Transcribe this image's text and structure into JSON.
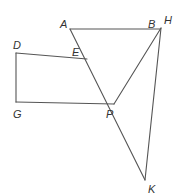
{
  "diagram": {
    "type": "geometry",
    "stroke_color": "#555555",
    "label_color": "#333333",
    "points": {
      "A": {
        "label": "A",
        "x": 70,
        "y": 29,
        "lx": 60,
        "ly": 28
      },
      "B": {
        "label": "B",
        "x": 160,
        "y": 29,
        "lx": 148,
        "ly": 28
      },
      "H": {
        "label": "H",
        "x": 161,
        "y": 28,
        "lx": 164,
        "ly": 24
      },
      "D": {
        "label": "D",
        "x": 16,
        "y": 53,
        "lx": 13,
        "ly": 49
      },
      "E": {
        "label": "E",
        "x": 87,
        "y": 59,
        "lx": 72,
        "ly": 56
      },
      "G": {
        "label": "G",
        "x": 16,
        "y": 102,
        "lx": 13,
        "ly": 118
      },
      "P": {
        "label": "P",
        "x": 114,
        "y": 104,
        "lx": 106,
        "ly": 118
      },
      "K": {
        "label": "K",
        "x": 145,
        "y": 180,
        "lx": 148,
        "ly": 193
      }
    },
    "segments": [
      {
        "from": "A",
        "to": "B",
        "name": "segment-ab"
      },
      {
        "from": "A",
        "to": "K",
        "name": "segment-ak"
      },
      {
        "from": "H",
        "to": "P",
        "name": "segment-hp"
      },
      {
        "from": "H",
        "to": "K",
        "name": "segment-hk"
      },
      {
        "from": "D",
        "to": "E",
        "name": "segment-de"
      },
      {
        "from": "D",
        "to": "G",
        "name": "segment-dg"
      },
      {
        "from": "G",
        "to": "P",
        "name": "segment-gp"
      }
    ]
  }
}
